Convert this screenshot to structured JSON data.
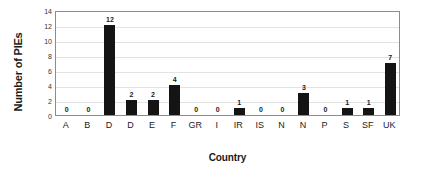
{
  "chart_data": {
    "type": "bar",
    "title": "",
    "xlabel": "Country",
    "ylabel": "Number of PIEs",
    "categories": [
      "A",
      "B",
      "D",
      "D",
      "E",
      "F",
      "GR",
      "I",
      "IR",
      "IS",
      "N",
      "N",
      "P",
      "S",
      "SF",
      "UK"
    ],
    "values": [
      0,
      0,
      12,
      2,
      2,
      4,
      0,
      0,
      1,
      0,
      0,
      3,
      0,
      1,
      1,
      7
    ],
    "data_labels": [
      "0",
      "0",
      "12",
      "2",
      "2",
      "4",
      "0",
      "0",
      "1",
      "0",
      "0",
      "3",
      "0",
      "1",
      "1",
      "7"
    ],
    "ylim": [
      0,
      14
    ],
    "y_ticks": [
      0,
      2,
      4,
      6,
      8,
      10,
      12,
      14
    ],
    "y_tick_labels": [
      "0",
      "2",
      "4",
      "6",
      "8",
      "10",
      "12",
      "14"
    ],
    "grid": true,
    "grid_axis": "y",
    "legend": false,
    "bar_color": "#141414",
    "grid_color": "#e2e2e2",
    "axis_color": "#8c8c8c",
    "background_color": "#ffffff"
  }
}
